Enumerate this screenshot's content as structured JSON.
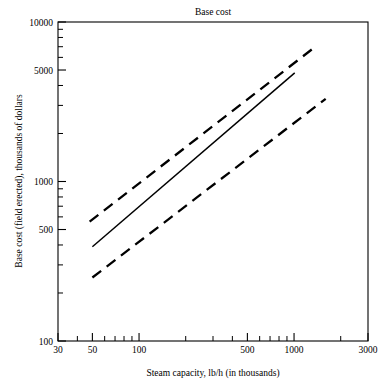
{
  "chart_data": {
    "type": "line",
    "title": "Base cost",
    "xlabel": "Steam capacity, lb/h (in thousands)",
    "ylabel": "Base cost (field erected), thousands of dollars",
    "xscale": "log",
    "yscale": "log",
    "xlim": [
      30,
      3000
    ],
    "ylim": [
      100,
      10000
    ],
    "grid": false,
    "legend": false,
    "xticks": [
      {
        "value": 30,
        "label": "30",
        "major": true
      },
      {
        "value": 40,
        "label": "",
        "major": false
      },
      {
        "value": 50,
        "label": "50",
        "major": true
      },
      {
        "value": 60,
        "label": "",
        "major": false
      },
      {
        "value": 70,
        "label": "",
        "major": false
      },
      {
        "value": 80,
        "label": "",
        "major": false
      },
      {
        "value": 90,
        "label": "",
        "major": false
      },
      {
        "value": 100,
        "label": "100",
        "major": true
      },
      {
        "value": 200,
        "label": "",
        "major": false
      },
      {
        "value": 300,
        "label": "",
        "major": false
      },
      {
        "value": 400,
        "label": "",
        "major": false
      },
      {
        "value": 500,
        "label": "500",
        "major": true
      },
      {
        "value": 600,
        "label": "",
        "major": false
      },
      {
        "value": 700,
        "label": "",
        "major": false
      },
      {
        "value": 800,
        "label": "",
        "major": false
      },
      {
        "value": 900,
        "label": "",
        "major": false
      },
      {
        "value": 1000,
        "label": "1000",
        "major": true
      },
      {
        "value": 2000,
        "label": "",
        "major": false
      },
      {
        "value": 3000,
        "label": "3000",
        "major": true
      }
    ],
    "yticks": [
      {
        "value": 100,
        "label": "100",
        "major": true
      },
      {
        "value": 200,
        "label": "",
        "major": false
      },
      {
        "value": 300,
        "label": "",
        "major": false
      },
      {
        "value": 400,
        "label": "",
        "major": false
      },
      {
        "value": 500,
        "label": "500",
        "major": true
      },
      {
        "value": 600,
        "label": "",
        "major": false
      },
      {
        "value": 700,
        "label": "",
        "major": false
      },
      {
        "value": 800,
        "label": "",
        "major": false
      },
      {
        "value": 900,
        "label": "",
        "major": false
      },
      {
        "value": 1000,
        "label": "1000",
        "major": true
      },
      {
        "value": 2000,
        "label": "",
        "major": false
      },
      {
        "value": 3000,
        "label": "",
        "major": false
      },
      {
        "value": 4000,
        "label": "",
        "major": false
      },
      {
        "value": 5000,
        "label": "5000",
        "major": true
      },
      {
        "value": 6000,
        "label": "",
        "major": false
      },
      {
        "value": 7000,
        "label": "",
        "major": false
      },
      {
        "value": 8000,
        "label": "",
        "major": false
      },
      {
        "value": 9000,
        "label": "",
        "major": false
      },
      {
        "value": 10000,
        "label": "10000",
        "major": true
      }
    ],
    "series": [
      {
        "name": "upper-bound",
        "style": "dashed",
        "color": "#000000",
        "points": [
          [
            48,
            560
          ],
          [
            1320,
            6800
          ]
        ]
      },
      {
        "name": "base-cost",
        "style": "solid",
        "color": "#000000",
        "points": [
          [
            50,
            390
          ],
          [
            1010,
            4800
          ]
        ]
      },
      {
        "name": "lower-bound",
        "style": "dashed",
        "color": "#000000",
        "points": [
          [
            50,
            250
          ],
          [
            1600,
            3300
          ]
        ]
      }
    ]
  }
}
